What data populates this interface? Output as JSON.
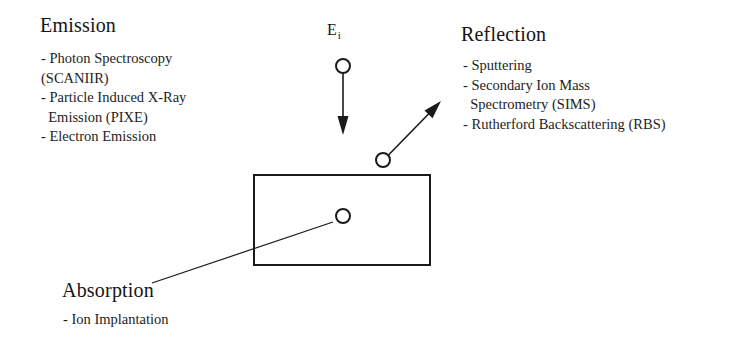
{
  "figure": {
    "title_visible": false,
    "background_color": "#ffffff",
    "ink_color": "#1a1a1a"
  },
  "beam": {
    "label_main": "E",
    "label_sub": "i",
    "incident_arrow": {
      "name": "incident-ion-arrow",
      "direction": "down",
      "start_circle": {
        "cx": 343,
        "cy": 66,
        "r": 7
      },
      "shaft": {
        "x1": 343,
        "y1": 73,
        "x2": 343,
        "y2": 120
      },
      "tip": {
        "x": 343,
        "y": 134
      }
    },
    "reflected_arrow": {
      "name": "reflected-particle-arrow",
      "direction": "up-right",
      "start_circle": {
        "cx": 383,
        "cy": 160,
        "r": 7
      },
      "shaft": {
        "x1": 389,
        "y1": 155,
        "x2": 430,
        "y2": 112
      },
      "tip": {
        "x": 441,
        "y": 101
      }
    }
  },
  "sample": {
    "name": "sample-rectangle",
    "x": 254,
    "y": 175,
    "width": 176,
    "height": 90,
    "implanted_ion_circle": {
      "cx": 343,
      "cy": 216,
      "r": 7
    },
    "leader_line": {
      "x1": 333,
      "y1": 222,
      "x2": 152,
      "y2": 283
    }
  },
  "emission": {
    "heading": "Emission",
    "items": [
      "- Photon Spectroscopy",
      "(SCANIIR)",
      "- Particle Induced X-Ray",
      "  Emission (PIXE)",
      "- Electron Emission"
    ]
  },
  "reflection": {
    "heading": "Reflection",
    "items": [
      "- Sputtering",
      "- Secondary Ion Mass",
      "  Spectrometry (SIMS)",
      "- Rutherford Backscattering (RBS)"
    ]
  },
  "absorption": {
    "heading": "Absorption",
    "items": [
      "- Ion Implantation"
    ]
  }
}
